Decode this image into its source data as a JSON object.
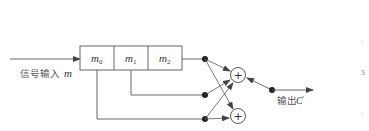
{
  "diagram": {
    "type": "convolutional-encoder",
    "input": {
      "label": "信号输入",
      "symbol": "m"
    },
    "register": {
      "cells": [
        {
          "symbol": "m",
          "subscript": "0"
        },
        {
          "symbol": "m",
          "subscript": "1"
        },
        {
          "symbol": "m",
          "subscript": "2"
        }
      ]
    },
    "adders": [
      {
        "id": "adder-top",
        "glyph": "+"
      },
      {
        "id": "adder-bottom",
        "glyph": "+"
      }
    ],
    "output": {
      "label": "输出",
      "symbol": "C",
      "prime": "′"
    },
    "colors": {
      "line": "#555555",
      "node": "#222222",
      "text": "#444444"
    },
    "edge_marks": [
      ":",
      "5",
      ":"
    ]
  }
}
